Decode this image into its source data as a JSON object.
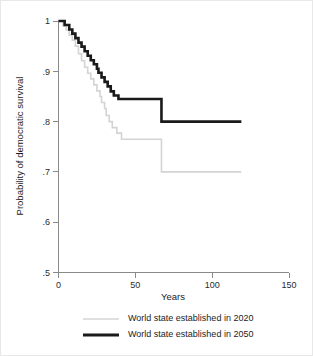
{
  "chart_data": {
    "type": "line",
    "subtype": "step-kaplan-meier",
    "title": "",
    "xlabel": "Years",
    "ylabel": "Probability of democratic survival",
    "xlim": [
      0,
      150
    ],
    "ylim": [
      0.5,
      1.0
    ],
    "xticks": [
      0,
      50,
      100,
      150
    ],
    "xtick_labels": [
      "0",
      "50",
      "100",
      "150"
    ],
    "yticks": [
      0.5,
      0.6,
      0.7,
      0.8,
      0.9,
      1.0
    ],
    "ytick_labels": [
      ".5",
      ".6",
      ".7",
      ".8",
      ".9",
      "1"
    ],
    "grid": false,
    "legend_position": "bottom",
    "series": [
      {
        "name": "World state established in 2020",
        "color": "#d4d4d4",
        "stroke_width": 1.6,
        "points": [
          [
            0,
            1.0
          ],
          [
            3,
            1.0
          ],
          [
            3,
            0.99
          ],
          [
            5,
            0.99
          ],
          [
            5,
            0.982
          ],
          [
            7,
            0.982
          ],
          [
            7,
            0.972
          ],
          [
            9,
            0.972
          ],
          [
            9,
            0.962
          ],
          [
            11,
            0.962
          ],
          [
            11,
            0.95
          ],
          [
            13,
            0.95
          ],
          [
            13,
            0.935
          ],
          [
            15,
            0.935
          ],
          [
            15,
            0.921
          ],
          [
            17,
            0.921
          ],
          [
            17,
            0.908
          ],
          [
            19,
            0.908
          ],
          [
            19,
            0.896
          ],
          [
            21,
            0.896
          ],
          [
            21,
            0.885
          ],
          [
            23,
            0.885
          ],
          [
            23,
            0.873
          ],
          [
            25,
            0.873
          ],
          [
            25,
            0.861
          ],
          [
            27,
            0.861
          ],
          [
            27,
            0.85
          ],
          [
            28,
            0.85
          ],
          [
            28,
            0.838
          ],
          [
            30,
            0.838
          ],
          [
            30,
            0.826
          ],
          [
            31,
            0.826
          ],
          [
            31,
            0.812
          ],
          [
            33,
            0.812
          ],
          [
            33,
            0.8
          ],
          [
            35,
            0.8
          ],
          [
            35,
            0.788
          ],
          [
            38,
            0.788
          ],
          [
            38,
            0.777
          ],
          [
            41,
            0.777
          ],
          [
            41,
            0.765
          ],
          [
            67,
            0.765
          ],
          [
            67,
            0.7
          ],
          [
            119,
            0.7
          ]
        ]
      },
      {
        "name": "World state established in 2050",
        "color": "#1a1a1a",
        "stroke_width": 2.6,
        "points": [
          [
            0,
            1.0
          ],
          [
            4,
            1.0
          ],
          [
            4,
            0.992
          ],
          [
            7,
            0.992
          ],
          [
            7,
            0.983
          ],
          [
            9,
            0.983
          ],
          [
            9,
            0.975
          ],
          [
            11,
            0.975
          ],
          [
            11,
            0.966
          ],
          [
            13,
            0.966
          ],
          [
            13,
            0.957
          ],
          [
            15,
            0.957
          ],
          [
            15,
            0.949
          ],
          [
            17,
            0.949
          ],
          [
            17,
            0.94
          ],
          [
            19,
            0.94
          ],
          [
            19,
            0.931
          ],
          [
            21,
            0.931
          ],
          [
            21,
            0.922
          ],
          [
            23,
            0.922
          ],
          [
            23,
            0.914
          ],
          [
            25,
            0.914
          ],
          [
            25,
            0.905
          ],
          [
            26,
            0.905
          ],
          [
            26,
            0.897
          ],
          [
            28,
            0.897
          ],
          [
            28,
            0.888
          ],
          [
            30,
            0.888
          ],
          [
            30,
            0.879
          ],
          [
            32,
            0.879
          ],
          [
            32,
            0.87
          ],
          [
            34,
            0.87
          ],
          [
            34,
            0.86
          ],
          [
            36,
            0.86
          ],
          [
            36,
            0.852
          ],
          [
            39,
            0.852
          ],
          [
            39,
            0.845
          ],
          [
            67,
            0.845
          ],
          [
            67,
            0.8
          ],
          [
            119,
            0.8
          ]
        ]
      }
    ]
  },
  "legend": {
    "items": [
      {
        "label": "World state established in 2020",
        "color": "#d4d4d4"
      },
      {
        "label": "World state established in 2050",
        "color": "#1a1a1a"
      }
    ]
  }
}
